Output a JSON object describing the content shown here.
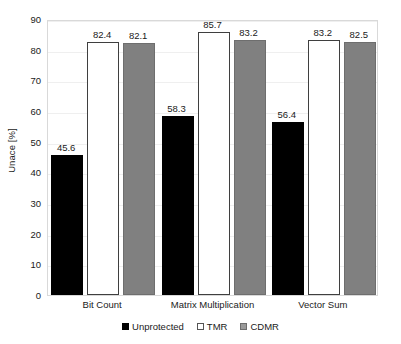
{
  "chart_data": {
    "type": "bar",
    "title": "",
    "subtitle": "",
    "xlabel": "",
    "ylabel": "Unace [%]",
    "categories": [
      "Bit Count",
      "Matrix Multiplication",
      "Vector Sum"
    ],
    "series": [
      {
        "name": "Unprotected",
        "color": "#000000",
        "values": [
          45.6,
          58.3,
          56.4
        ]
      },
      {
        "name": "TMR",
        "color": "#ffffff",
        "values": [
          82.4,
          85.7,
          83.2
        ]
      },
      {
        "name": "CDMR",
        "color": "#808080",
        "values": [
          82.1,
          83.2,
          82.5
        ]
      }
    ],
    "ylim": [
      0,
      90
    ],
    "ytick_step": 10,
    "ytick_labels": [
      "0",
      "10",
      "20",
      "30",
      "40",
      "50",
      "60",
      "70",
      "80",
      "90"
    ],
    "data_labels": [
      [
        "45.6",
        "82.4",
        "82.1"
      ],
      [
        "58.3",
        "85.7",
        "83.2"
      ],
      [
        "56.4",
        "83.2",
        "82.5"
      ]
    ],
    "grid": true,
    "grid_axis": "y",
    "legend_position": "bottom",
    "legend_entries": [
      "Unprotected",
      "TMR",
      "CDMR"
    ],
    "plot_background": "#ffffff",
    "plot_border_color": "#d9d9d9",
    "gridline_color": "#efefef",
    "text_color": "#1a1a1a"
  }
}
